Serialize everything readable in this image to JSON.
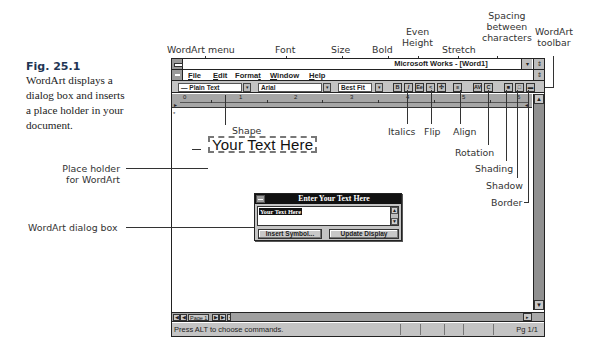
{
  "caption": {
    "figure": "Fig. 25.1",
    "description": "WordArt displays a dialog box and inserts a place holder in your document."
  },
  "callouts": {
    "wordart_menu": "WordArt menu",
    "font": "Font",
    "size": "Size",
    "bold": "Bold",
    "even_height": [
      "Even",
      "Height"
    ],
    "stretch": "Stretch",
    "spacing": [
      "Spacing",
      "between",
      "characters"
    ],
    "wordart_toolbar": [
      "WordArt",
      "toolbar"
    ],
    "shape": "Shape",
    "italics": "Italics",
    "flip": "Flip",
    "align": "Align",
    "rotation": "Rotation",
    "shading": "Shading",
    "shadow": "Shadow",
    "border": "Border",
    "placeholder": [
      "Place holder",
      "for WordArt"
    ],
    "dialog_box": "WordArt dialog box"
  },
  "window": {
    "title": "Microsoft Works - [Word1]",
    "controls": {
      "minimize": "▾",
      "restore": "⇕",
      "doc_restore": "⇕"
    },
    "menu": [
      {
        "label": "File",
        "underline": "F"
      },
      {
        "label": "Edit",
        "underline": "E"
      },
      {
        "label": "Format",
        "underline": "t"
      },
      {
        "label": "Window",
        "underline": "W"
      },
      {
        "label": "Help",
        "underline": "H"
      }
    ],
    "toolbar": {
      "shape_value": "— Plain Text",
      "font_value": "Arial",
      "size_value": "Best Fit",
      "buttons": [
        {
          "name": "bold",
          "glyph": "B"
        },
        {
          "name": "italic",
          "glyph": "I"
        },
        {
          "name": "even-height",
          "glyph": "Ee"
        },
        {
          "name": "flip",
          "glyph": "<"
        },
        {
          "name": "stretch",
          "glyph": "✣"
        },
        {
          "name": "align",
          "glyph": "≡"
        },
        {
          "name": "spacing",
          "glyph": "AV"
        },
        {
          "name": "rotation",
          "glyph": "C"
        },
        {
          "name": "shading",
          "glyph": "■"
        },
        {
          "name": "shadow",
          "glyph": "□"
        },
        {
          "name": "border",
          "glyph": "▬"
        }
      ]
    },
    "ruler": {
      "numbers": [
        "0",
        "1",
        "2",
        "3",
        "4",
        "5",
        "6"
      ]
    },
    "document": {
      "placeholder_text": "Your Text Here"
    },
    "hscroll": {
      "page_label": "Page 1",
      "first": "◀",
      "prev": "◀",
      "next": "▶",
      "last": "▶",
      "extra": "◂"
    },
    "vscroll": {
      "up": "▲",
      "down": "▼"
    },
    "status": {
      "text": "Press ALT to choose commands.",
      "page": "Pg 1/1"
    }
  },
  "dialog": {
    "title": "Enter Your Text Here",
    "text_value": "Your Text Here",
    "buttons": {
      "insert_symbol": "Insert Symbol...",
      "update_display": "Update Display"
    },
    "scroll": {
      "up": "▲",
      "down": "▼"
    }
  }
}
